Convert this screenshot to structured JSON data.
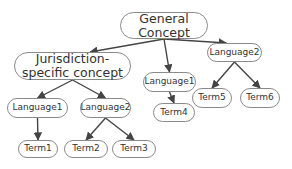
{
  "nodes": {
    "general": {
      "label": "General Concept"
    },
    "jurisdiction": {
      "label": "Jurisdiction-specific concept"
    },
    "lang1_left": {
      "label": "Language1"
    },
    "lang2_left": {
      "label": "Language2"
    },
    "term1": {
      "label": "Term1"
    },
    "term2": {
      "label": "Term2"
    },
    "term3": {
      "label": "Term3"
    },
    "lang1_mid": {
      "label": "Language1"
    },
    "term4": {
      "label": "Term4"
    },
    "lang2_right": {
      "label": "Language2"
    },
    "term5": {
      "label": "Term5"
    },
    "term6": {
      "label": "Term6"
    }
  },
  "edges": [
    {
      "from": "general",
      "to": "jurisdiction"
    },
    {
      "from": "general",
      "to": "lang1_mid"
    },
    {
      "from": "general",
      "to": "lang2_right"
    },
    {
      "from": "jurisdiction",
      "to": "lang1_left"
    },
    {
      "from": "jurisdiction",
      "to": "lang2_left"
    },
    {
      "from": "lang1_left",
      "to": "term1"
    },
    {
      "from": "lang2_left",
      "to": "term2"
    },
    {
      "from": "lang2_left",
      "to": "term3"
    },
    {
      "from": "lang1_mid",
      "to": "term4"
    },
    {
      "from": "lang2_right",
      "to": "term5"
    },
    {
      "from": "lang2_right",
      "to": "term6"
    }
  ],
  "colors": {
    "edge": "#444444",
    "border": "#8a8a8a",
    "text": "#333333"
  }
}
